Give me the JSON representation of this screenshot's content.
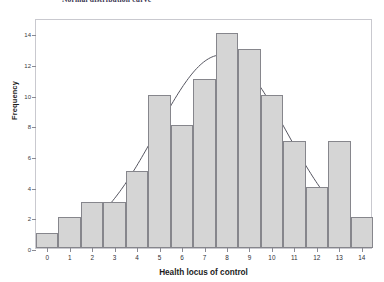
{
  "chart_data": {
    "type": "bar",
    "title": "Normal distribution curve",
    "xlabel": "Health locus of control",
    "ylabel": "Frequency",
    "categories": [
      "0",
      "1",
      "2",
      "3",
      "4",
      "5",
      "6",
      "7",
      "8",
      "9",
      "10",
      "11",
      "12",
      "13",
      "14"
    ],
    "values": [
      1,
      2,
      3,
      3,
      5,
      10,
      8,
      11,
      14,
      13,
      10,
      7,
      4,
      7,
      2
    ],
    "xlim": [
      -0.5,
      14.5
    ],
    "ylim": [
      0,
      15
    ],
    "ytick_labels": [
      "0",
      "2",
      "4",
      "6",
      "8",
      "10",
      "12",
      "14"
    ],
    "ytick_values": [
      0,
      2,
      4,
      6,
      8,
      10,
      12,
      14
    ],
    "grid": false,
    "legend": false,
    "overlay": {
      "name": "normal-curve",
      "type": "line",
      "mean": 7.8,
      "std": 2.9,
      "peak": 12.7,
      "color": "#555560"
    },
    "colors": {
      "bar_fill": "#d5d5d5",
      "bar_border": "#86868c",
      "frame": "#c9c9cf",
      "text": "#1c1c1c",
      "curve": "#555560"
    }
  }
}
